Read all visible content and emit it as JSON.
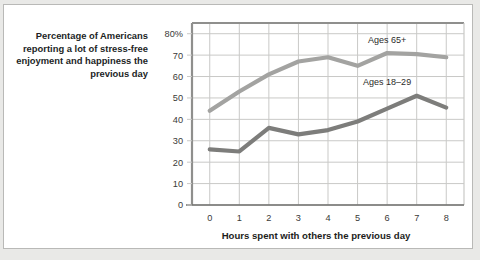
{
  "caption": "Percentage of Americans reporting a lot of stress-free enjoyment and happiness the previous day",
  "colors": {
    "series_65plus": "#a3a3a1",
    "series_18to29": "#7d7d7b",
    "grid": "#c9c9c7",
    "frame": "#8f8f8d",
    "panel_border": "#b9b9b7",
    "background": "#e9e9e7",
    "panel": "#ffffff",
    "text": "#221f1f"
  },
  "chart_data": {
    "type": "line",
    "title": "",
    "xlabel": "Hours spent with others the previous day",
    "ylabel": "",
    "x": [
      0,
      1,
      2,
      3,
      4,
      5,
      6,
      7,
      8
    ],
    "xtick_labels": [
      "0",
      "1",
      "2",
      "3",
      "4",
      "5",
      "6",
      "7",
      "8"
    ],
    "ytick_labels": [
      "0",
      "10",
      "20",
      "30",
      "40",
      "50",
      "60",
      "70",
      "80%"
    ],
    "yticks": [
      0,
      10,
      20,
      30,
      40,
      50,
      60,
      70,
      80
    ],
    "xlim": [
      -0.6,
      8.6
    ],
    "ylim": [
      0,
      85
    ],
    "grid": true,
    "legend_position": "inline-annotation",
    "series": [
      {
        "name": "Ages 65+",
        "label": "Ages 65+",
        "color": "#a3a3a1",
        "values": [
          44,
          53,
          61,
          67,
          69,
          65,
          71,
          70.5,
          69
        ]
      },
      {
        "name": "Ages 18-29",
        "label": "Ages 18–29",
        "color": "#7d7d7b",
        "values": [
          26,
          25,
          36,
          33,
          35,
          39,
          45,
          51,
          45.5
        ]
      }
    ]
  }
}
